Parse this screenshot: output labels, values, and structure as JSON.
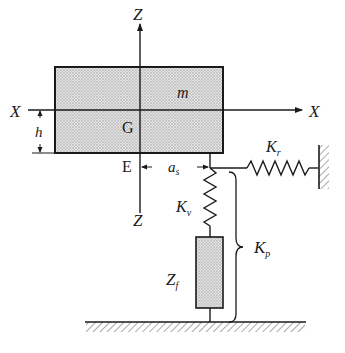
{
  "diagram": {
    "type": "mechanical-model",
    "labels": {
      "z_axis_top": "Z",
      "z_axis_bottom": "Z",
      "x_axis_left": "X",
      "x_axis_right": "X",
      "mass": "m",
      "center_of_gravity": "G",
      "height": "h",
      "point_e": "E",
      "offset_main": "a",
      "offset_sub": "s",
      "horizontal_spring_main": "K",
      "horizontal_spring_sub": "r",
      "vertical_spring_main": "K",
      "vertical_spring_sub": "v",
      "total_stiffness_main": "K",
      "total_stiffness_sub": "p",
      "damper_main": "Z",
      "damper_sub": "f"
    },
    "components": [
      {
        "id": "mass-block",
        "kind": "rigid body",
        "label": "m"
      },
      {
        "id": "vertical-spring",
        "kind": "spring",
        "label": "Kv"
      },
      {
        "id": "horizontal-spring",
        "kind": "spring",
        "label": "Kr"
      },
      {
        "id": "damper",
        "kind": "impedance element",
        "label": "Zf"
      },
      {
        "id": "brace",
        "kind": "grouping brace",
        "label": "Kp"
      },
      {
        "id": "ground",
        "kind": "fixed ground"
      },
      {
        "id": "wall",
        "kind": "fixed wall"
      }
    ],
    "colors": {
      "line": "#1a1a1a",
      "fill": "#d4d4d4"
    }
  }
}
